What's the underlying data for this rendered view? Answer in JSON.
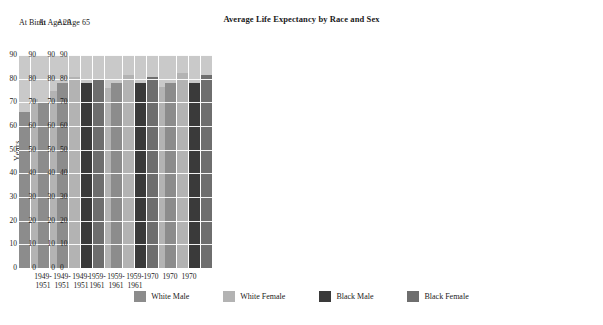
{
  "chart_data": {
    "type": "bar",
    "title": "Average Life Expectancy by Race and Sex",
    "xlabel": "",
    "ylabel": "Years",
    "ylim": [
      0,
      90
    ],
    "yticks": [
      0,
      10,
      20,
      30,
      40,
      50,
      60,
      70,
      80,
      90
    ],
    "ytick_labels": [
      "0",
      "10",
      "20",
      "30",
      "40",
      "50",
      "60",
      "70",
      "80",
      "90"
    ],
    "grid": true,
    "legend_position": "bottom",
    "categories": [
      "1949-1951",
      "1959-1961",
      "1970"
    ],
    "category_lines": [
      [
        "1949-",
        "1951"
      ],
      [
        "1959-",
        "1961"
      ],
      [
        "1970",
        ""
      ]
    ],
    "panels": [
      {
        "label": "At  Birth",
        "series": [
          {
            "name": "White Male",
            "values": [
              66.0,
              67.0,
              68.0
            ]
          },
          {
            "name": "White Female",
            "values": [
              71.5,
              74.5,
              75.5
            ]
          },
          {
            "name": "Black Male",
            "values": [
              58.5,
              61.0,
              60.0
            ]
          },
          {
            "name": "Black Female",
            "values": [
              62.0,
              65.5,
              68.0
            ]
          }
        ]
      },
      {
        "label": "At Age 20",
        "series": [
          {
            "name": "White Male",
            "values": [
              70.0,
              70.0,
              70.0
            ]
          },
          {
            "name": "White Female",
            "values": [
              75.0,
              76.0,
              76.5
            ]
          },
          {
            "name": "Black Male",
            "values": [
              64.0,
              65.5,
              63.0
            ]
          },
          {
            "name": "Black Female",
            "values": [
              66.5,
              70.0,
              70.5
            ]
          }
        ]
      },
      {
        "label": "At Age 65",
        "series": [
          {
            "name": "White Male",
            "values": [
              78.0,
              78.0,
              78.0
            ]
          },
          {
            "name": "White Female",
            "values": [
              80.5,
              81.5,
              82.5
            ]
          },
          {
            "name": "Black Male",
            "values": [
              78.0,
              78.0,
              78.0
            ]
          },
          {
            "name": "Black Female",
            "values": [
              79.5,
              80.5,
              81.5
            ]
          }
        ]
      }
    ],
    "legend": [
      {
        "name": "White Male",
        "color": "#8c8c8c"
      },
      {
        "name": "White Female",
        "color": "#b3b3b3"
      },
      {
        "name": "Black Male",
        "color": "#3a3a3a"
      },
      {
        "name": "Black Female",
        "color": "#6e6e6e"
      }
    ],
    "panel_background": "#c9c9c9",
    "gridline_color": "#ffffff"
  }
}
